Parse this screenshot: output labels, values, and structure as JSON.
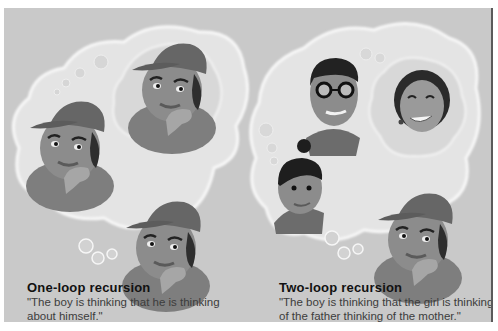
{
  "colors": {
    "background": "#c9c9c9",
    "cloud": "#e6e6e6",
    "cloud_edge": "#f7f7f7",
    "skin": "#8a8a8a",
    "cap": "#6b6b6b",
    "hair": "#2b2b2b"
  },
  "panels": [
    {
      "id": "one-loop",
      "title": "One-loop recursion",
      "quote": "\"The boy is thinking that he is thinking about himself.\"",
      "figures": [
        "boy-thinking",
        "boy-in-thought",
        "boy-thinker"
      ]
    },
    {
      "id": "two-loop",
      "title": "Two-loop recursion",
      "quote": "\"The boy is thinking that the girl is thinking of the father thinking of the mother.\"",
      "figures": [
        "father-with-glasses",
        "mother",
        "girl",
        "boy-thinker"
      ]
    }
  ]
}
